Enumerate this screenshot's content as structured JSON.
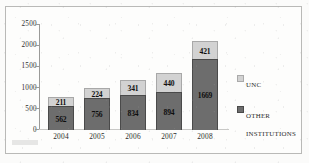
{
  "chart_data": {
    "type": "bar",
    "subtype": "stacked-vertical",
    "title": "",
    "xlabel": "",
    "ylabel": "",
    "categories": [
      "2004",
      "2005",
      "2006",
      "2007",
      "2008"
    ],
    "series": [
      {
        "name": "OTHER INSTITUTIONS",
        "color": "#6d6d6d",
        "values": [
          562,
          756,
          834,
          894,
          1669
        ]
      },
      {
        "name": "UNC",
        "color": "#d2d2d2",
        "values": [
          211,
          224,
          341,
          440,
          421
        ]
      }
    ],
    "totals": [
      773,
      980,
      1175,
      1334,
      2090
    ],
    "ylim": [
      0,
      2500
    ],
    "ytick_labels": [
      "0",
      "500",
      "1000",
      "1500",
      "2000",
      "2500"
    ],
    "ytick_values": [
      0,
      500,
      1000,
      1500,
      2000,
      2500
    ],
    "grid": false,
    "legend_position": "right",
    "data_labels": true
  },
  "legend": {
    "items": [
      {
        "label": "UNC",
        "color": "#d2d2d2",
        "swatch": "legend-swatch-unc"
      },
      {
        "label": "OTHER INSTITUTIONS",
        "color": "#6d6d6d",
        "swatch": "legend-swatch-other"
      }
    ]
  },
  "colors": {
    "series_unc": "#d2d2d2",
    "series_other": "#6d6d6d",
    "axis": "#9a9a98",
    "frame": "#b9b9b7",
    "background": "#fdfdfc",
    "text": "#2b2b2b"
  }
}
